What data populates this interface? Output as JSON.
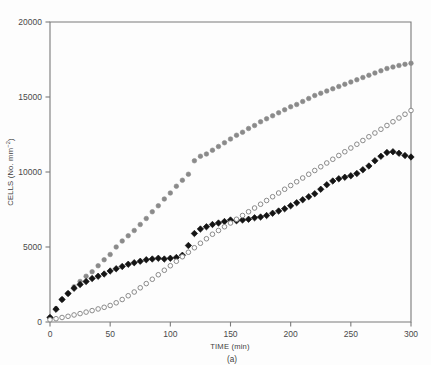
{
  "figure": {
    "caption": "(a)",
    "background_color": "#fdfdfd",
    "axis_color": "#7a7a7a"
  },
  "chart_data": {
    "type": "scatter",
    "title": "",
    "xlabel": "TIME (min)",
    "ylabel": "CELLS (No. mm−2)",
    "ylabel_base": "CELLS (No. mm",
    "ylabel_exponent": "−2",
    "ylabel_close": ")",
    "xlim": [
      0,
      300
    ],
    "ylim": [
      0,
      20000
    ],
    "xticks": [
      0,
      50,
      100,
      150,
      200,
      250,
      300
    ],
    "xtick_labels": [
      "0",
      "50",
      "100",
      "150",
      "200",
      "250",
      "300"
    ],
    "yticks": [
      0,
      5000,
      10000,
      15000,
      20000
    ],
    "ytick_labels": [
      "0",
      "5000",
      "10000",
      "15000",
      "20000"
    ],
    "grid": false,
    "legend": "none",
    "series": [
      {
        "name": "gray-filled-circles",
        "marker": "circle-filled",
        "color": "#8a8a8a",
        "x": [
          0,
          5,
          10,
          15,
          20,
          25,
          30,
          35,
          40,
          45,
          50,
          55,
          60,
          65,
          70,
          75,
          80,
          85,
          90,
          95,
          100,
          105,
          110,
          115,
          120,
          125,
          130,
          135,
          140,
          145,
          150,
          155,
          160,
          165,
          170,
          175,
          180,
          185,
          190,
          195,
          200,
          205,
          210,
          215,
          220,
          225,
          230,
          235,
          240,
          245,
          250,
          255,
          260,
          265,
          270,
          275,
          280,
          285,
          290,
          295,
          300
        ],
        "y": [
          300,
          900,
          1500,
          1900,
          2350,
          2700,
          3050,
          3350,
          3750,
          4150,
          4500,
          5000,
          5400,
          5750,
          6100,
          6500,
          6900,
          7350,
          7750,
          8200,
          8600,
          9050,
          9450,
          9850,
          10750,
          11050,
          11200,
          11450,
          11700,
          11950,
          12200,
          12450,
          12650,
          12900,
          13100,
          13350,
          13550,
          13750,
          13950,
          14150,
          14350,
          14500,
          14700,
          14900,
          15100,
          15250,
          15400,
          15550,
          15700,
          15850,
          16000,
          16150,
          16300,
          16450,
          16600,
          16750,
          16900,
          17000,
          17100,
          17180,
          17250
        ]
      },
      {
        "name": "black-filled-diamonds",
        "marker": "diamond-filled",
        "color": "#141414",
        "x": [
          0,
          5,
          10,
          15,
          20,
          25,
          30,
          35,
          40,
          45,
          50,
          55,
          60,
          65,
          70,
          75,
          80,
          85,
          90,
          95,
          100,
          105,
          110,
          115,
          120,
          125,
          130,
          135,
          140,
          145,
          150,
          155,
          160,
          165,
          170,
          175,
          180,
          185,
          190,
          195,
          200,
          205,
          210,
          215,
          220,
          225,
          230,
          235,
          240,
          245,
          250,
          255,
          260,
          265,
          270,
          275,
          280,
          285,
          290,
          295,
          300
        ],
        "y": [
          300,
          850,
          1500,
          1900,
          2250,
          2500,
          2700,
          2900,
          3050,
          3200,
          3400,
          3550,
          3700,
          3850,
          3950,
          4050,
          4150,
          4200,
          4250,
          4200,
          4250,
          4300,
          4450,
          5100,
          5900,
          6200,
          6350,
          6500,
          6600,
          6700,
          6800,
          6750,
          6800,
          6850,
          6950,
          7000,
          7100,
          7250,
          7400,
          7550,
          7750,
          7950,
          8150,
          8350,
          8550,
          8850,
          9150,
          9400,
          9550,
          9650,
          9750,
          9900,
          10150,
          10400,
          10750,
          11050,
          11300,
          11350,
          11250,
          11100,
          11000
        ]
      },
      {
        "name": "open-circles",
        "marker": "circle-open",
        "color": "#8a8a8a",
        "x": [
          0,
          5,
          10,
          15,
          20,
          25,
          30,
          35,
          40,
          45,
          50,
          55,
          60,
          65,
          70,
          75,
          80,
          85,
          90,
          95,
          100,
          105,
          110,
          115,
          120,
          125,
          130,
          135,
          140,
          145,
          150,
          155,
          160,
          165,
          170,
          175,
          180,
          185,
          190,
          195,
          200,
          205,
          210,
          215,
          220,
          225,
          230,
          235,
          240,
          245,
          250,
          255,
          260,
          265,
          270,
          275,
          280,
          285,
          290,
          295,
          300
        ],
        "y": [
          150,
          220,
          300,
          380,
          470,
          560,
          660,
          760,
          870,
          980,
          1100,
          1280,
          1500,
          1750,
          2000,
          2280,
          2560,
          2850,
          3150,
          3450,
          3750,
          4050,
          4350,
          4650,
          4950,
          5250,
          5550,
          5850,
          6100,
          6350,
          6600,
          6850,
          7100,
          7350,
          7600,
          7850,
          8100,
          8350,
          8600,
          8850,
          9100,
          9350,
          9600,
          9850,
          10100,
          10350,
          10600,
          10850,
          11100,
          11350,
          11600,
          11850,
          12100,
          12350,
          12600,
          12850,
          13100,
          13350,
          13600,
          13850,
          14100
        ]
      }
    ]
  }
}
